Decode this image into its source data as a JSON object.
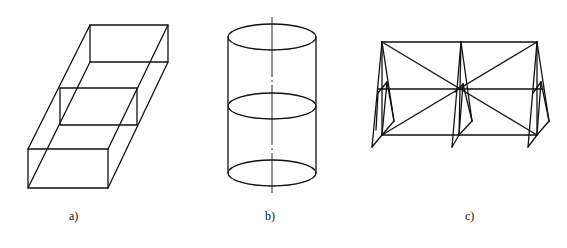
{
  "figures": [
    {
      "id": "a",
      "label": "a)",
      "description": "Wireframe of open rectangular box (cuboid) drawn in oblique projection with three cross-section rectangles"
    },
    {
      "id": "b",
      "label": "b)",
      "description": "Cylinder with top, middle, and bottom elliptical cross-sections and vertical centre axis"
    },
    {
      "id": "c",
      "label": "c)",
      "description": "Space truss frame with three A-frame supports, top/middle/bottom chords and X-bracing diagonals"
    }
  ],
  "colors": {
    "line": "#111111",
    "background": "#ffffff"
  }
}
